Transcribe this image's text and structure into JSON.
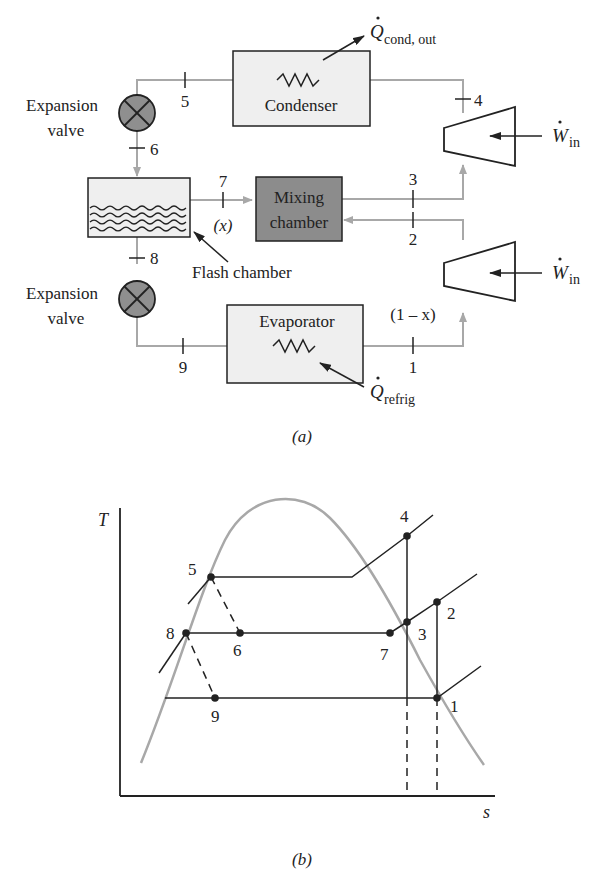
{
  "figure_a": {
    "caption": "(a)",
    "components": {
      "condenser": "Condenser",
      "evaporator": "Evaporator",
      "mixing_chamber_line1": "Mixing",
      "mixing_chamber_line2": "chamber",
      "flash_chamber": "Flash chamber",
      "expansion_valve_top_line1": "Expansion",
      "expansion_valve_top_line2": "valve",
      "expansion_valve_bottom_line1": "Expansion",
      "expansion_valve_bottom_line2": "valve"
    },
    "heat_work": {
      "q_cond_symbol": "Q",
      "q_cond_sub": "cond, out",
      "q_refrig_symbol": "Q",
      "q_refrig_sub": "refrig",
      "w_in_top_symbol": "W",
      "w_in_top_sub": "in",
      "w_in_bottom_symbol": "W",
      "w_in_bottom_sub": "in"
    },
    "state_labels": {
      "s1": "1",
      "s2": "2",
      "s3": "3",
      "s4": "4",
      "s5": "5",
      "s6": "6",
      "s7": "7",
      "s8": "8",
      "s9": "9"
    },
    "mass_fractions": {
      "x": "(x)",
      "one_minus_x": "(1 – x)"
    }
  },
  "figure_b": {
    "caption": "(b)",
    "y_axis_label": "T",
    "x_axis_label": "s",
    "points": {
      "p1": "1",
      "p2": "2",
      "p3": "3",
      "p4": "4",
      "p5": "5",
      "p6": "6",
      "p7": "7",
      "p8": "8",
      "p9": "9"
    }
  },
  "colors": {
    "line_dark": "#222222",
    "line_gray": "#a8a8a8",
    "box_fill": "#efefef",
    "mixing_fill": "#8c8c8c",
    "valve_fill": "#8f8f8f"
  }
}
